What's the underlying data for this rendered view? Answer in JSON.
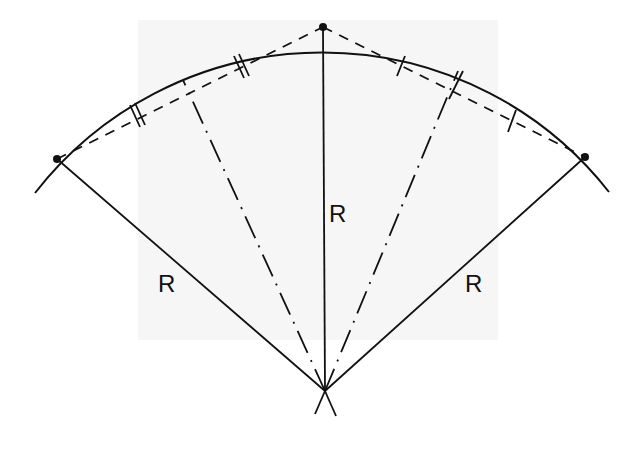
{
  "diagram": {
    "labels": {
      "radius_left": "R",
      "radius_center": "R",
      "radius_right": "R"
    },
    "points": [
      "left-point",
      "top-point",
      "right-point",
      "center"
    ],
    "tick_marks": {
      "left_chord": "double ticks (equal halves)",
      "right_chord": "single ticks (equal halves)"
    },
    "colors": {
      "ink": "#111111",
      "background": "#ffffff"
    }
  }
}
